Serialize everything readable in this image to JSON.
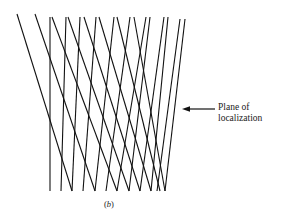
{
  "figure": {
    "caption_open": "(",
    "caption_letter": "b",
    "caption_close": ")",
    "annotation": {
      "line1": "Plane of",
      "line2": "localization",
      "arrow": {
        "x1": 215,
        "y1": 109,
        "x2": 182,
        "y2": 109
      }
    },
    "stroke_color": "#111111",
    "rays_down_right": [
      {
        "x1": 17,
        "y1": 14,
        "x2": 72,
        "y2": 191
      },
      {
        "x1": 35,
        "y1": 14,
        "x2": 95,
        "y2": 191
      },
      {
        "x1": 52,
        "y1": 17,
        "x2": 117,
        "y2": 191
      },
      {
        "x1": 68,
        "y1": 17,
        "x2": 129,
        "y2": 191
      },
      {
        "x1": 84,
        "y1": 17,
        "x2": 140,
        "y2": 191
      },
      {
        "x1": 99,
        "y1": 17,
        "x2": 151,
        "y2": 191
      },
      {
        "x1": 117,
        "y1": 17,
        "x2": 160,
        "y2": 191
      },
      {
        "x1": 134,
        "y1": 17,
        "x2": 165,
        "y2": 191
      }
    ],
    "rays_vertical": [
      {
        "x1": 50,
        "y1": 17,
        "x2": 50,
        "y2": 191
      }
    ],
    "rays_down_left": [
      {
        "x1": 66,
        "y1": 17,
        "x2": 61,
        "y2": 191
      },
      {
        "x1": 80,
        "y1": 17,
        "x2": 72,
        "y2": 191
      },
      {
        "x1": 96,
        "y1": 17,
        "x2": 83,
        "y2": 191
      },
      {
        "x1": 114,
        "y1": 17,
        "x2": 95,
        "y2": 191
      },
      {
        "x1": 130,
        "y1": 17,
        "x2": 106,
        "y2": 191
      },
      {
        "x1": 146,
        "y1": 17,
        "x2": 117,
        "y2": 191
      },
      {
        "x1": 150,
        "y1": 17,
        "x2": 129,
        "y2": 191
      },
      {
        "x1": 164,
        "y1": 17,
        "x2": 140,
        "y2": 191
      },
      {
        "x1": 168,
        "y1": 17,
        "x2": 151,
        "y2": 191
      },
      {
        "x1": 180,
        "y1": 19,
        "x2": 157,
        "y2": 191
      },
      {
        "x1": 185,
        "y1": 19,
        "x2": 165,
        "y2": 191
      }
    ]
  }
}
